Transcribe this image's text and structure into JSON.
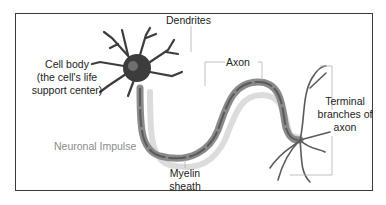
{
  "diagram": {
    "labels": {
      "dendrites": "Dendrites",
      "cell_body_line1": "Cell body",
      "cell_body_line2": "(the cell's life",
      "cell_body_line3": "support center)",
      "axon": "Axon",
      "terminal_line1": "Terminal",
      "terminal_line2": "branches of",
      "terminal_line3": "axon",
      "impulse": "Neuronal Impulse",
      "myelin_line1": "Myelin",
      "myelin_line2": "sheath"
    },
    "colors": {
      "frame": "#3a3a3a",
      "neuron_dark": "#3c3c3c",
      "myelin": "#8a8a8a",
      "impulse_path": "#d8d8d8",
      "leader_line": "#b0b0b0",
      "text": "#222222",
      "impulse_text": "#8a8a8a"
    }
  }
}
